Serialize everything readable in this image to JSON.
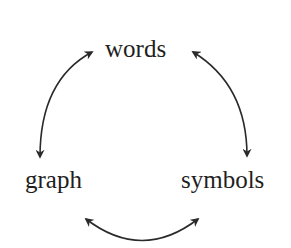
{
  "diagram": {
    "type": "cycle",
    "nodes": [
      {
        "id": "words",
        "label": "words"
      },
      {
        "id": "graph",
        "label": "graph"
      },
      {
        "id": "symbols",
        "label": "symbols"
      }
    ],
    "edges": [
      {
        "from": "words",
        "to": "graph",
        "bidirectional": true
      },
      {
        "from": "words",
        "to": "symbols",
        "bidirectional": true
      },
      {
        "from": "graph",
        "to": "symbols",
        "bidirectional": true
      }
    ],
    "colors": {
      "stroke": "#2a2a2a",
      "text": "#1f1f1f",
      "background": "#ffffff"
    }
  }
}
